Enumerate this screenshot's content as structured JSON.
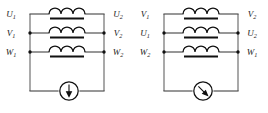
{
  "figure": {
    "type": "electrical-schematic",
    "colors": {
      "background": "#ffffff",
      "wire": "#4a4a4a",
      "rail": "#6a6a6a",
      "coil": "#111111",
      "label": "#1a1a1a"
    }
  },
  "diagrams": [
    {
      "id": "left",
      "name": "winding-diagram-left",
      "rows": [
        {
          "index": 0,
          "left_terminal": {
            "base": "U",
            "sub": "1",
            "text": "U1"
          },
          "right_terminal": {
            "base": "U",
            "sub": "2",
            "text": "U2"
          },
          "coil": {
            "arcs": 3,
            "has_core_bar": true
          },
          "left_junction": false,
          "right_junction": false
        },
        {
          "index": 1,
          "left_terminal": {
            "base": "V",
            "sub": "1",
            "text": "V1"
          },
          "right_terminal": {
            "base": "V",
            "sub": "2",
            "text": "V2"
          },
          "coil": {
            "arcs": 3,
            "has_core_bar": true
          },
          "left_junction": true,
          "right_junction": true
        },
        {
          "index": 2,
          "left_terminal": {
            "base": "W",
            "sub": "1",
            "text": "W1"
          },
          "right_terminal": {
            "base": "W",
            "sub": "2",
            "text": "W2"
          },
          "coil": {
            "arcs": 3,
            "has_core_bar": true
          },
          "left_junction": true,
          "right_junction": true
        }
      ],
      "meter": {
        "name": "meter-left",
        "shape": "circle",
        "needle": "vertical-down",
        "label": ""
      }
    },
    {
      "id": "right",
      "name": "winding-diagram-right",
      "rows": [
        {
          "index": 0,
          "left_terminal": {
            "base": "V",
            "sub": "1",
            "text": "V1"
          },
          "right_terminal": {
            "base": "V",
            "sub": "2",
            "text": "V2"
          },
          "coil": {
            "arcs": 3,
            "has_core_bar": true
          },
          "left_junction": false,
          "right_junction": false
        },
        {
          "index": 1,
          "left_terminal": {
            "base": "U",
            "sub": "1",
            "text": "U1"
          },
          "right_terminal": {
            "base": "U",
            "sub": "2",
            "text": "U2"
          },
          "coil": {
            "arcs": 3,
            "has_core_bar": true
          },
          "left_junction": true,
          "right_junction": true
        },
        {
          "index": 2,
          "left_terminal": {
            "base": "W",
            "sub": "2",
            "text": "W2"
          },
          "right_terminal": {
            "base": "W",
            "sub": "1",
            "text": "W1"
          },
          "coil": {
            "arcs": 3,
            "has_core_bar": true
          },
          "left_junction": true,
          "right_junction": true
        }
      ],
      "meter": {
        "name": "meter-right",
        "shape": "circle",
        "needle": "diagonal-down-right",
        "label": ""
      }
    }
  ]
}
